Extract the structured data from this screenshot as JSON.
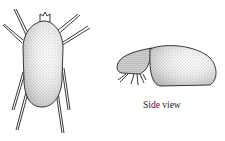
{
  "figure": {
    "top_view": {
      "subject": "mite-dorsal-view"
    },
    "side_view": {
      "subject": "mite-side-view",
      "label": "Side view"
    }
  }
}
